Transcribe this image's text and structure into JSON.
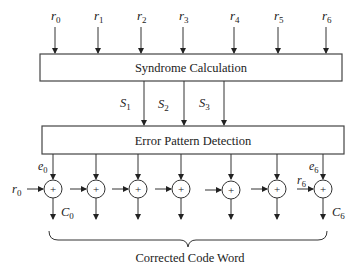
{
  "diagram": {
    "type": "block-diagram",
    "inputs": [
      {
        "label": "r",
        "sub": "0",
        "x": 55
      },
      {
        "label": "r",
        "sub": "1",
        "x": 98
      },
      {
        "label": "r",
        "sub": "2",
        "x": 141
      },
      {
        "label": "r",
        "sub": "3",
        "x": 183
      },
      {
        "label": "r",
        "sub": "4",
        "x": 234
      },
      {
        "label": "r",
        "sub": "5",
        "x": 278
      },
      {
        "label": "r",
        "sub": "6",
        "x": 326
      }
    ],
    "syndrome_block": {
      "label": "Syndrome Calculation"
    },
    "syndromes": [
      {
        "label": "S",
        "sub": "1",
        "x": 144
      },
      {
        "label": "S",
        "sub": "2",
        "x": 184
      },
      {
        "label": "S",
        "sub": "3",
        "x": 224
      }
    ],
    "error_block": {
      "label": "Error Pattern Detection"
    },
    "xor_nodes": [
      {
        "x": 53,
        "symbol": "+"
      },
      {
        "x": 96,
        "symbol": "+"
      },
      {
        "x": 138,
        "symbol": "+"
      },
      {
        "x": 181,
        "symbol": "+"
      },
      {
        "x": 231,
        "symbol": "+"
      },
      {
        "x": 277,
        "symbol": "+"
      },
      {
        "x": 323,
        "symbol": "+"
      }
    ],
    "error_labels": {
      "first": {
        "label": "e",
        "sub": "0"
      },
      "last": {
        "label": "e",
        "sub": "6"
      }
    },
    "side_inputs": {
      "first": {
        "label": "r",
        "sub": "0"
      },
      "last": {
        "label": "r",
        "sub": "6"
      }
    },
    "output_labels": {
      "first": {
        "label": "C",
        "sub": "0"
      },
      "last": {
        "label": "C",
        "sub": "6"
      }
    },
    "brace_label": "Corrected Code Word"
  }
}
